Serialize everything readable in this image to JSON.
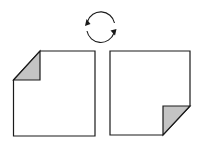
{
  "diagram": {
    "colors": {
      "stroke": "#1a1a1a",
      "fold_fill": "#c4c4c4",
      "paper_fill": "#ffffff"
    },
    "elements": [
      {
        "id": "rotation-arrows",
        "type": "circular-arrows",
        "direction": "clockwise"
      },
      {
        "id": "left-sheet",
        "fold_corner": "top-left"
      },
      {
        "id": "right-sheet",
        "fold_corner": "bottom-right"
      }
    ]
  }
}
